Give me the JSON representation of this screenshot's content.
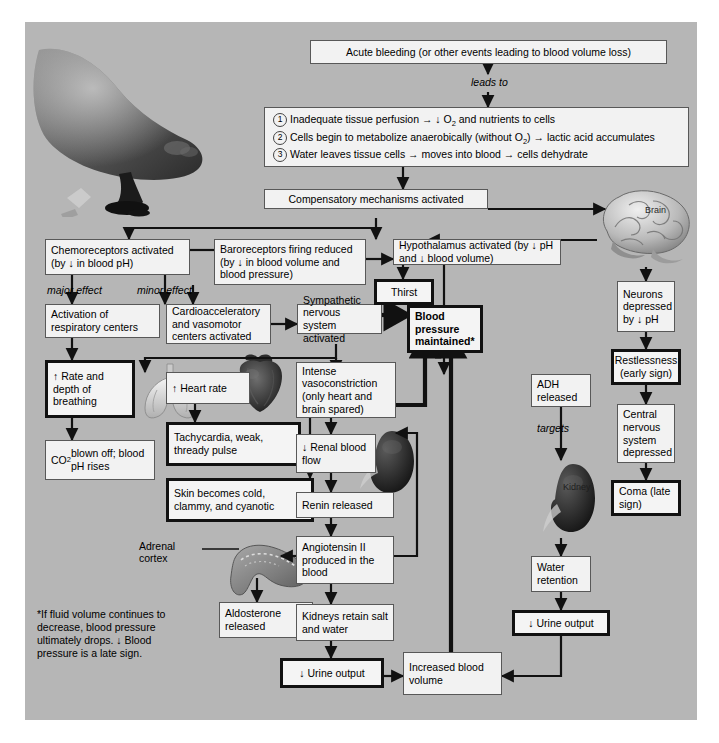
{
  "figure": {
    "background_color": "#b6b6b6",
    "box_fill": "#f2f2f2",
    "line_color": "#111111"
  },
  "nodes": {
    "acute_bleeding": "Acute bleeding (or other events leading to blood volume loss)",
    "leads_to": "leads to",
    "consequences": [
      "Inadequate tissue perfusion → ↓ O₂ and nutrients to cells",
      "Cells begin to metabolize anaerobically (without O₂) → lactic acid accumulates",
      "Water leaves tissue cells → moves into blood → cells dehydrate"
    ],
    "consequence_numbers": [
      "1",
      "2",
      "3"
    ],
    "compensatory": "Compensatory mechanisms activated",
    "chemoreceptors": "Chemoreceptors activated (by ↓ in blood pH)",
    "baroreceptors": "Baroreceptors firing reduced (by ↓ in blood volume and blood pressure)",
    "hypothalamus": "Hypothalamus activated (by ↓ pH and ↓ blood volume)",
    "major_effect": "major effect",
    "minor_effect": "minor effect",
    "respiratory_centers": "Activation of respiratory centers",
    "cardioaccel": "Cardioacceleratory and vasomotor centers activated",
    "sympathetic": "Sympathetic nervous system activated",
    "thirst": "Thirst",
    "bp_maintained": "Blood pressure maintained*",
    "neurons_depressed": "Neurons depressed by ↓ pH",
    "restlessness": "Restlessness (early sign)",
    "cns_depressed": "Central nervous system depressed",
    "coma": "Coma (late sign)",
    "rate_depth": "↑ Rate and depth of breathing",
    "co2_blown": "CO₂ blown off; blood pH rises",
    "heart_rate": "↑ Heart rate",
    "tachycardia": "Tachycardia, weak, thready pulse",
    "skin_cold": "Skin becomes cold, clammy, and cyanotic",
    "vasoconstriction": "Intense vasoconstriction (only heart and brain spared)",
    "renal_flow": "↓ Renal blood flow",
    "renin": "Renin released",
    "angiotensin": "Angiotensin II produced in the blood",
    "aldosterone": "Aldosterone released",
    "kidneys_retain": "Kidneys retain salt and water",
    "urine_output_left": "↓ Urine output",
    "increased_volume": "Increased blood volume",
    "adh": "ADH released",
    "targets": "targets",
    "water_retention": "Water retention",
    "urine_output_right": "↓ Urine output"
  },
  "labels": {
    "brain": "Brain",
    "kidney": "Kidney",
    "adrenal_cortex": "Adrenal cortex"
  },
  "footnote": "*If fluid volume continues to decrease, blood pressure ultimately drops. ↓ Blood pressure is a late sign."
}
